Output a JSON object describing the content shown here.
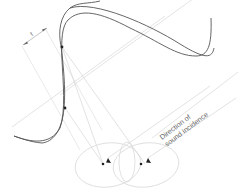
{
  "diagram": {
    "label_line1": "Direction of",
    "label_line2": "sound incidence",
    "dimension_label": "t",
    "colors": {
      "curve": "#555555",
      "guides": "#d4d4d4",
      "ellipses": "#d8d8d8",
      "markers": "#222222",
      "text": "#6a6a6a"
    },
    "elements": [
      "s-curve",
      "dimension-marker",
      "parallel-guide-lines",
      "incidence-lines",
      "polar-ellipses",
      "arrowheads",
      "source-dots"
    ]
  }
}
